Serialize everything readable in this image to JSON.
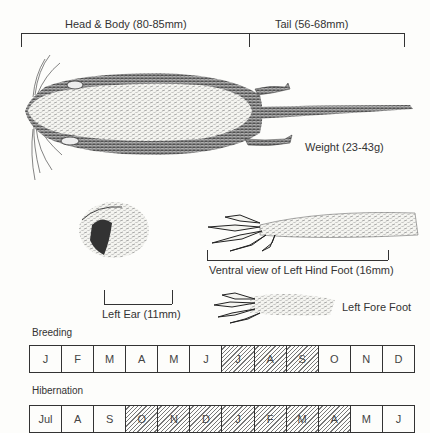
{
  "measurements": {
    "head_body": "Head & Body (80-85mm)",
    "tail": "Tail (56-68mm)",
    "weight": "Weight (23-43g)",
    "hind_foot": "Ventral view of Left Hind Foot (16mm)",
    "ear": "Left Ear (11mm)",
    "fore_foot": "Left Fore Foot"
  },
  "breeding": {
    "title": "Breeding",
    "months": [
      {
        "label": "J",
        "active": false
      },
      {
        "label": "F",
        "active": false
      },
      {
        "label": "M",
        "active": false
      },
      {
        "label": "A",
        "active": false
      },
      {
        "label": "M",
        "active": false
      },
      {
        "label": "J",
        "active": false
      },
      {
        "label": "J",
        "active": true
      },
      {
        "label": "A",
        "active": true
      },
      {
        "label": "S",
        "active": true
      },
      {
        "label": "O",
        "active": false
      },
      {
        "label": "N",
        "active": false
      },
      {
        "label": "D",
        "active": false
      }
    ]
  },
  "hibernation": {
    "title": "Hibernation",
    "months": [
      {
        "label": "Jul",
        "active": false
      },
      {
        "label": "A",
        "active": false
      },
      {
        "label": "S",
        "active": false
      },
      {
        "label": "O",
        "active": true
      },
      {
        "label": "N",
        "active": true
      },
      {
        "label": "D",
        "active": true
      },
      {
        "label": "J",
        "active": true
      },
      {
        "label": "F",
        "active": true
      },
      {
        "label": "M",
        "active": true
      },
      {
        "label": "A",
        "active": true
      },
      {
        "label": "M",
        "active": false
      },
      {
        "label": "J",
        "active": false
      }
    ]
  }
}
